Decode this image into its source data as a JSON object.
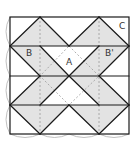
{
  "diagram": {
    "labels": {
      "A": "A",
      "B": "B",
      "B_prime": "B'",
      "C": "C"
    },
    "colors": {
      "line": "#1a1a1a",
      "fill": "#e3e3e3",
      "dashed": "#9a9a9a",
      "arc": "#b0b0b0",
      "background": "#ffffff"
    }
  }
}
